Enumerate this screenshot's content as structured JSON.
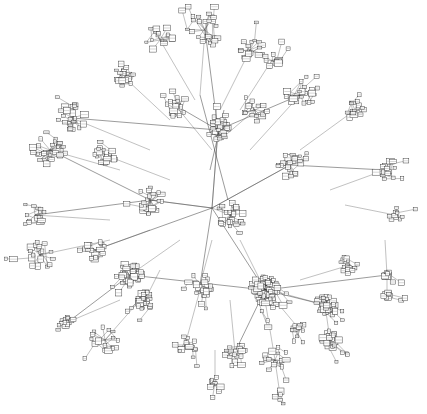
{
  "diagram": {
    "type": "network-graph",
    "layout": "force-directed",
    "canvas": {
      "width": 427,
      "height": 414,
      "background": "#ffffff"
    },
    "colors": {
      "edge": "#4a4a4a",
      "node_stroke": "#333333",
      "node_fill": "#ffffff"
    },
    "labels_legible": false,
    "root": [
      212,
      208
    ],
    "clusters": [
      {
        "name": "top-center",
        "c": [
          205,
          30
        ],
        "r": 18,
        "n": 22,
        "parent": [
          200,
          95
        ]
      },
      {
        "name": "top-left-blob",
        "c": [
          125,
          78
        ],
        "r": 9,
        "n": 18,
        "parent": [
          170,
          120
        ]
      },
      {
        "name": "top-upper-left",
        "c": [
          160,
          40
        ],
        "r": 14,
        "n": 14,
        "parent": [
          195,
          100
        ]
      },
      {
        "name": "top-right-arm",
        "c": [
          250,
          50
        ],
        "r": 14,
        "n": 14,
        "parent": [
          220,
          110
        ]
      },
      {
        "name": "top-right-knot",
        "c": [
          272,
          60
        ],
        "r": 8,
        "n": 10,
        "parent": [
          240,
          110
        ]
      },
      {
        "name": "center-hub-top",
        "c": [
          218,
          130
        ],
        "r": 11,
        "n": 30,
        "parent": [
          212,
          208
        ]
      },
      {
        "name": "left-upper",
        "c": [
          72,
          118
        ],
        "r": 14,
        "n": 22,
        "parent": [
          150,
          150
        ]
      },
      {
        "name": "left-far",
        "c": [
          50,
          150
        ],
        "r": 16,
        "n": 24,
        "parent": [
          120,
          170
        ]
      },
      {
        "name": "left-mid",
        "c": [
          105,
          155
        ],
        "r": 10,
        "n": 16,
        "parent": [
          170,
          180
        ]
      },
      {
        "name": "upper-right",
        "c": [
          300,
          95
        ],
        "r": 14,
        "n": 20,
        "parent": [
          250,
          150
        ]
      },
      {
        "name": "right-upper-knot",
        "c": [
          355,
          110
        ],
        "r": 10,
        "n": 14,
        "parent": [
          300,
          150
        ]
      },
      {
        "name": "right-arm",
        "c": [
          385,
          170
        ],
        "r": 12,
        "n": 14,
        "parent": [
          330,
          190
        ]
      },
      {
        "name": "right-far",
        "c": [
          395,
          215
        ],
        "r": 8,
        "n": 8,
        "parent": [
          345,
          205
        ]
      },
      {
        "name": "center-right",
        "c": [
          290,
          165
        ],
        "r": 14,
        "n": 22,
        "parent": [
          212,
          208
        ]
      },
      {
        "name": "center-left",
        "c": [
          150,
          200
        ],
        "r": 14,
        "n": 20,
        "parent": [
          212,
          208
        ]
      },
      {
        "name": "center",
        "c": [
          230,
          215
        ],
        "r": 14,
        "n": 22,
        "parent": [
          212,
          208
        ]
      },
      {
        "name": "left-west",
        "c": [
          35,
          215
        ],
        "r": 10,
        "n": 14,
        "parent": [
          110,
          220
        ]
      },
      {
        "name": "left-southwest",
        "c": [
          40,
          255
        ],
        "r": 14,
        "n": 18,
        "parent": [
          110,
          240
        ]
      },
      {
        "name": "west-mid",
        "c": [
          95,
          250
        ],
        "r": 10,
        "n": 14,
        "parent": [
          150,
          230
        ]
      },
      {
        "name": "lower-left-hub",
        "c": [
          130,
          275
        ],
        "r": 12,
        "n": 28,
        "parent": [
          180,
          240
        ]
      },
      {
        "name": "lower-left-dense",
        "c": [
          145,
          300
        ],
        "r": 9,
        "n": 26,
        "parent": [
          160,
          270
        ]
      },
      {
        "name": "far-left-knot",
        "c": [
          68,
          322
        ],
        "r": 6,
        "n": 14,
        "parent": [
          120,
          300
        ]
      },
      {
        "name": "lower-center",
        "c": [
          200,
          285
        ],
        "r": 12,
        "n": 18,
        "parent": [
          212,
          240
        ]
      },
      {
        "name": "big-hub",
        "c": [
          265,
          290
        ],
        "r": 14,
        "n": 60,
        "parent": [
          240,
          240
        ]
      },
      {
        "name": "right-hub",
        "c": [
          325,
          305
        ],
        "r": 10,
        "n": 40,
        "parent": [
          270,
          290
        ]
      },
      {
        "name": "right-lower-fan",
        "c": [
          330,
          340
        ],
        "r": 9,
        "n": 24,
        "parent": [
          325,
          305
        ]
      },
      {
        "name": "right-vert-1",
        "c": [
          387,
          275
        ],
        "r": 4,
        "n": 12,
        "parent": [
          385,
          240
        ]
      },
      {
        "name": "right-vert-2",
        "c": [
          387,
          295
        ],
        "r": 4,
        "n": 12,
        "parent": [
          387,
          275
        ]
      },
      {
        "name": "right-upper-lower",
        "c": [
          350,
          265
        ],
        "r": 10,
        "n": 12,
        "parent": [
          300,
          280
        ]
      },
      {
        "name": "bottom-left",
        "c": [
          105,
          340
        ],
        "r": 14,
        "n": 16,
        "parent": [
          140,
          300
        ]
      },
      {
        "name": "bottom-center-left",
        "c": [
          185,
          345
        ],
        "r": 12,
        "n": 14,
        "parent": [
          200,
          290
        ]
      },
      {
        "name": "bottom-center",
        "c": [
          235,
          352
        ],
        "r": 10,
        "n": 18,
        "parent": [
          230,
          300
        ]
      },
      {
        "name": "bottom-tail",
        "c": [
          215,
          385
        ],
        "r": 8,
        "n": 8,
        "parent": [
          215,
          350
        ]
      },
      {
        "name": "bottom-right",
        "c": [
          275,
          360
        ],
        "r": 14,
        "n": 14,
        "parent": [
          265,
          300
        ]
      },
      {
        "name": "bottom-right-tail",
        "c": [
          280,
          395
        ],
        "r": 6,
        "n": 6,
        "parent": [
          275,
          360
        ]
      },
      {
        "name": "bottom-far-right",
        "c": [
          300,
          330
        ],
        "r": 8,
        "n": 10,
        "parent": [
          275,
          300
        ]
      },
      {
        "name": "upper-center-right",
        "c": [
          255,
          110
        ],
        "r": 12,
        "n": 14,
        "parent": [
          220,
          140
        ]
      },
      {
        "name": "upper-center-left",
        "c": [
          175,
          105
        ],
        "r": 12,
        "n": 16,
        "parent": [
          212,
          150
        ]
      }
    ],
    "long_edges": [
      [
        [
          212,
          208
        ],
        [
          218,
          130
        ]
      ],
      [
        [
          212,
          208
        ],
        [
          265,
          290
        ]
      ],
      [
        [
          212,
          208
        ],
        [
          150,
          200
        ]
      ],
      [
        [
          218,
          130
        ],
        [
          205,
          30
        ]
      ],
      [
        [
          218,
          130
        ],
        [
          300,
          95
        ]
      ],
      [
        [
          218,
          130
        ],
        [
          72,
          118
        ]
      ],
      [
        [
          265,
          290
        ],
        [
          325,
          305
        ]
      ],
      [
        [
          265,
          290
        ],
        [
          130,
          275
        ]
      ],
      [
        [
          150,
          200
        ],
        [
          50,
          150
        ]
      ],
      [
        [
          290,
          165
        ],
        [
          385,
          170
        ]
      ],
      [
        [
          212,
          208
        ],
        [
          290,
          165
        ]
      ],
      [
        [
          130,
          275
        ],
        [
          68,
          322
        ]
      ],
      [
        [
          265,
          290
        ],
        [
          387,
          275
        ]
      ],
      [
        [
          212,
          208
        ],
        [
          200,
          285
        ]
      ],
      [
        [
          218,
          130
        ],
        [
          175,
          105
        ]
      ],
      [
        [
          150,
          200
        ],
        [
          35,
          215
        ]
      ],
      [
        [
          212,
          208
        ],
        [
          95,
          250
        ]
      ],
      [
        [
          265,
          290
        ],
        [
          235,
          352
        ]
      ],
      [
        [
          200,
          95
        ],
        [
          228,
          200
        ]
      ],
      [
        [
          224,
          110
        ],
        [
          210,
          170
        ]
      ]
    ]
  }
}
